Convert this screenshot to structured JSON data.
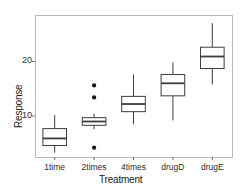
{
  "chart_data": {
    "type": "boxplot",
    "title": "",
    "xlabel": "Treatment",
    "ylabel": "Response",
    "categories": [
      "1time",
      "2times",
      "4times",
      "drugD",
      "drugE"
    ],
    "ytick_labels": [
      "10",
      "20"
    ],
    "ytick_values": [
      10,
      20
    ],
    "ylim": [
      2.5,
      28.5
    ],
    "grid": false,
    "legend": "none",
    "box_fill": "#ffffff",
    "box_stroke": "#3d3d3d",
    "outlier_color": "#141414",
    "panel_border": "#b9b9b9",
    "boxes": [
      {
        "category": "1time",
        "lower_whisker": 3.3,
        "q1": 4.6,
        "median": 5.9,
        "q3": 7.7,
        "upper_whisker": 10.2,
        "outliers": []
      },
      {
        "category": "2times",
        "lower_whisker": 7.6,
        "q1": 8.3,
        "median": 9.0,
        "q3": 9.7,
        "upper_whisker": 10.4,
        "outliers": [
          4.2,
          13.4,
          15.6
        ]
      },
      {
        "category": "4times",
        "lower_whisker": 8.5,
        "q1": 10.8,
        "median": 12.2,
        "q3": 13.6,
        "upper_whisker": 17.6,
        "outliers": []
      },
      {
        "category": "drugD",
        "lower_whisker": 9.2,
        "q1": 13.7,
        "median": 16.0,
        "q3": 17.6,
        "upper_whisker": 19.8,
        "outliers": []
      },
      {
        "category": "drugE",
        "lower_whisker": 15.8,
        "q1": 18.7,
        "median": 20.9,
        "q3": 22.6,
        "upper_whisker": 27.0,
        "outliers": []
      }
    ]
  }
}
